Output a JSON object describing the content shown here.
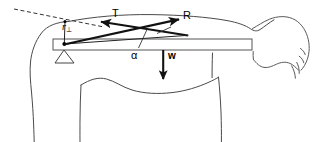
{
  "figure": {
    "type": "physics-force-diagram",
    "view": "human torso and head in profile, left shoulder with horizontal arm",
    "width": 329,
    "height": 142,
    "background_color": "#ffffff",
    "labels": {
      "tension": "T",
      "reaction": "R",
      "weight": "w",
      "angle": "α",
      "lever_arm": "r",
      "lever_arm_subscript": "⊥"
    },
    "label_positions": {
      "tension": {
        "x": 112,
        "y": 8
      },
      "reaction": {
        "x": 183,
        "y": 10
      },
      "weight": {
        "x": 168,
        "y": 51
      },
      "angle": {
        "x": 131,
        "y": 50
      },
      "lever_arm": {
        "x": 62,
        "y": 22
      }
    },
    "colors": {
      "force_vector": "#111111",
      "body_outline": "#4a4a4a",
      "head_outline": "#5a5a5a",
      "bar_outline": "#555555",
      "dashed_guide": "#333333",
      "fulcrum": "#444444"
    },
    "elements": {
      "arm_bar": {
        "x": 53,
        "y": 39,
        "width": 199,
        "height": 11
      },
      "fulcrum_triangle": {
        "apex_x": 64,
        "apex_y": 50,
        "base_left_x": 55,
        "base_right_x": 74,
        "base_y": 63
      },
      "pivot_point": {
        "x": 64,
        "y": 44
      },
      "upper_attachment_point": {
        "x": 65,
        "y": 21
      },
      "weight_arrow": {
        "x": 163,
        "y_start": 50,
        "y_end": 80
      },
      "tension_arrow": {
        "tail_x": 188,
        "tail_y": 35,
        "head_x": 99,
        "head_y": 21
      },
      "reaction_arrow": {
        "tail_x": 64,
        "tail_y": 44,
        "head_x": 180,
        "head_y": 19
      },
      "dashed_guide_line": {
        "x_start": 14,
        "y_start": 9,
        "x_end": 104,
        "y_end": 27
      }
    }
  }
}
